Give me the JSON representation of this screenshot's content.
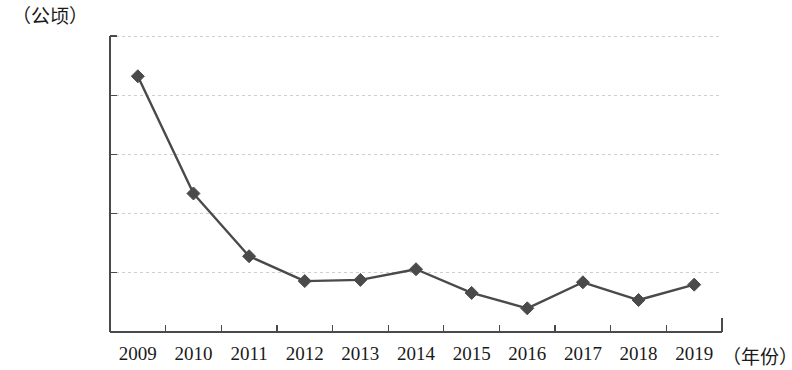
{
  "chart_data": {
    "type": "line",
    "title": "",
    "subtitle": "",
    "unit_label": "（公顷）",
    "xlabel": "（年份）",
    "ylabel": "",
    "categories": [
      "2009",
      "2010",
      "2011",
      "2012",
      "2013",
      "2014",
      "2015",
      "2016",
      "2017",
      "2018",
      "2019"
    ],
    "values": [
      216000,
      117000,
      64000,
      43000,
      44000,
      53000,
      33000,
      20000,
      42000,
      27000,
      40000
    ],
    "series": [
      {
        "name": "面积",
        "values": [
          216000,
          117000,
          64000,
          43000,
          44000,
          53000,
          33000,
          20000,
          42000,
          27000,
          40000
        ]
      }
    ],
    "ylim": [
      0,
      250000
    ],
    "yticks": [
      0,
      50000,
      100000,
      150000,
      200000,
      250000
    ],
    "ytick_labels": [
      "0",
      "50000",
      "100000",
      "150000",
      "200000",
      "250000"
    ],
    "grid": "horizontal-dashed",
    "legend": "none",
    "line_color": "#4a4a4a",
    "marker_color": "#4a4a4a",
    "marker_shape": "diamond",
    "axis_color": "#4a4a4a",
    "grid_color": "#cfcfcf"
  }
}
